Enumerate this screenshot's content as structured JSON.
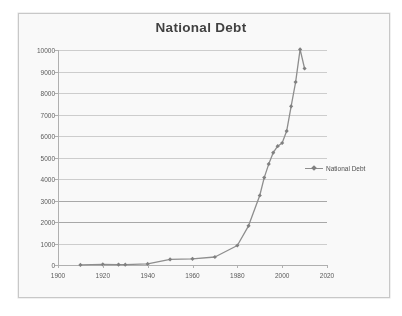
{
  "figure": {
    "title": "National Debt",
    "frame_color": "#c9c9c9",
    "background": "#fdfdfd"
  },
  "legend": {
    "position": "right",
    "entries": [
      {
        "label": "National Debt",
        "color": "#8c8c8c",
        "marker": "diamond"
      }
    ]
  },
  "chart_data": {
    "type": "line",
    "title": "National Debt",
    "xlabel": "",
    "ylabel": "",
    "xlim": [
      1900,
      2020
    ],
    "ylim": [
      0,
      10000
    ],
    "xticks": [
      1900,
      1920,
      1940,
      1960,
      1980,
      2000,
      2020
    ],
    "yticks": [
      0,
      1000,
      2000,
      3000,
      4000,
      5000,
      6000,
      7000,
      8000,
      9000,
      10000
    ],
    "grid": "horizontal",
    "marker": "diamond",
    "line_color": "#8c8c8c",
    "series": [
      {
        "name": "National Debt",
        "x": [
          1910,
          1920,
          1927,
          1930,
          1940,
          1950,
          1960,
          1970,
          1980,
          1985,
          1990,
          1992,
          1994,
          1996,
          1998,
          2000,
          2002,
          2004,
          2006,
          2008,
          2010
        ],
        "values": [
          3,
          26,
          18,
          16,
          51,
          257,
          286,
          371,
          908,
          1823,
          3233,
          4065,
          4693,
          5225,
          5526,
          5674,
          6228,
          7379,
          8507,
          10025,
          9140
        ]
      }
    ]
  },
  "axes": {
    "y_tick_labels": [
      "10000",
      "9000",
      "8000",
      "7000",
      "6000",
      "5000",
      "4000",
      "3000",
      "2000",
      "1000",
      "0"
    ],
    "x_tick_labels": [
      "1900",
      "1920",
      "1940",
      "1960",
      "1980",
      "2000",
      "2020"
    ]
  }
}
